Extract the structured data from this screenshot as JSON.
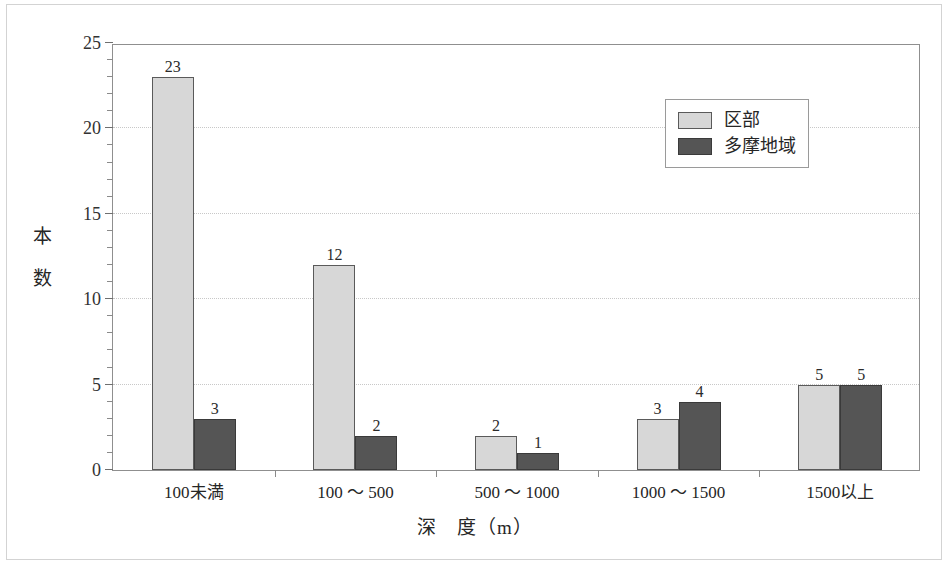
{
  "chart_data": {
    "type": "bar",
    "title": "",
    "xlabel": "深　度（m）",
    "ylabel": "本　数",
    "categories": [
      "100未満",
      "100 ～ 500",
      "500 ～ 1000",
      "1000 ～ 1500",
      "1500以上"
    ],
    "series": [
      {
        "name": "区部",
        "color": "#d7d7d7",
        "values": [
          23,
          12,
          2,
          3,
          5
        ]
      },
      {
        "name": "多摩地域",
        "color": "#555555",
        "values": [
          3,
          2,
          1,
          4,
          5
        ]
      }
    ],
    "ylim": [
      0,
      25
    ],
    "yticks": [
      0,
      5,
      10,
      15,
      20,
      25
    ],
    "ytick_labels": [
      "0",
      "5",
      "10",
      "15",
      "20",
      "25"
    ],
    "y_minor_tick_step": 1,
    "grid": "horizontal-dotted",
    "legend_position": "top-right",
    "data_labels": true
  },
  "axis": {
    "y_tick_labels": [
      "0",
      "5",
      "10",
      "15",
      "20",
      "25"
    ],
    "y_title": "本　数",
    "x_title": "深　度（m）",
    "x_categories": [
      "100未満",
      "100 ～ 500",
      "500 ～ 1000",
      "1000 ～ 1500",
      "1500以上"
    ]
  },
  "legend": {
    "items": [
      {
        "label": "区部",
        "swatch": "light"
      },
      {
        "label": "多摩地域",
        "swatch": "dark"
      }
    ]
  },
  "bar_labels": {
    "g1": {
      "light": "23",
      "dark": "3"
    },
    "g2": {
      "light": "12",
      "dark": "2"
    },
    "g3": {
      "light": "2",
      "dark": "1"
    },
    "g4": {
      "light": "3",
      "dark": "4"
    },
    "g5": {
      "light": "5",
      "dark": "5"
    }
  },
  "colors": {
    "series_light": "#d7d7d7",
    "series_dark": "#555555",
    "frame": "#8f8f8f",
    "grid": "#c8c8c8"
  }
}
